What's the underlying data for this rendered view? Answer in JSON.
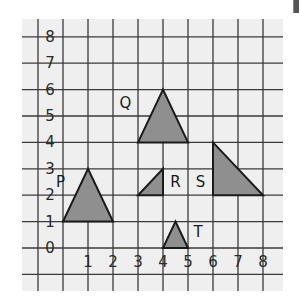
{
  "diagram": {
    "type": "coordinate-grid",
    "x_range": [
      -1,
      9
    ],
    "y_range": [
      -1,
      9
    ],
    "x_tick_labels": [
      {
        "value": 1,
        "label": "1"
      },
      {
        "value": 2,
        "label": "2"
      },
      {
        "value": 3,
        "label": "3"
      },
      {
        "value": 4,
        "label": "4"
      },
      {
        "value": 5,
        "label": "5"
      },
      {
        "value": 6,
        "label": "6"
      },
      {
        "value": 7,
        "label": "7"
      },
      {
        "value": 8,
        "label": "8"
      }
    ],
    "y_tick_labels": [
      {
        "value": 0,
        "label": "0"
      },
      {
        "value": 1,
        "label": "1"
      },
      {
        "value": 2,
        "label": "2"
      },
      {
        "value": 3,
        "label": "3"
      },
      {
        "value": 4,
        "label": "4"
      },
      {
        "value": 5,
        "label": "5"
      },
      {
        "value": 6,
        "label": "6"
      },
      {
        "value": 7,
        "label": "7"
      },
      {
        "value": 8,
        "label": "8"
      }
    ],
    "shapes": [
      {
        "name": "P",
        "vertices": [
          [
            0,
            1
          ],
          [
            2,
            1
          ],
          [
            1,
            3
          ]
        ],
        "label_at": [
          -0.1,
          2.5
        ]
      },
      {
        "name": "Q",
        "vertices": [
          [
            3,
            4
          ],
          [
            5,
            4
          ],
          [
            4,
            6
          ]
        ],
        "label_at": [
          2.5,
          5.5
        ]
      },
      {
        "name": "R",
        "vertices": [
          [
            3,
            2
          ],
          [
            4,
            2
          ],
          [
            4,
            3
          ]
        ],
        "label_at": [
          4.5,
          2.5
        ]
      },
      {
        "name": "S",
        "vertices": [
          [
            6,
            4
          ],
          [
            6,
            2
          ],
          [
            8,
            2
          ]
        ],
        "label_at": [
          5.5,
          2.5
        ]
      },
      {
        "name": "T",
        "vertices": [
          [
            4,
            0
          ],
          [
            5,
            0
          ],
          [
            4.5,
            1
          ]
        ],
        "label_at": [
          5.4,
          0.6
        ]
      }
    ],
    "colors": {
      "fill": "#8f8f8f",
      "stroke": "#1a1a1a",
      "grid": "#3a3a3a",
      "background": "#efefef"
    }
  }
}
